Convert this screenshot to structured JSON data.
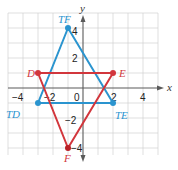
{
  "figure": {
    "type": "coordinate-plane",
    "axes": {
      "x_label": "x",
      "y_label": "y",
      "x_range": [
        -4.5,
        4.5
      ],
      "y_range": [
        -5,
        5
      ],
      "x_tick_labels": [
        "-4",
        "-2",
        "0",
        "2",
        "4"
      ],
      "y_tick_labels": [
        "4",
        "2",
        "-2",
        "-4"
      ],
      "origin_label": "0",
      "grid": true
    },
    "triangles": [
      {
        "name": "DEF",
        "color": "#d2363c",
        "vertices": [
          {
            "label": "D",
            "x": -3,
            "y": 1
          },
          {
            "label": "E",
            "x": 2,
            "y": 1
          },
          {
            "label": "F",
            "x": -1,
            "y": -4
          }
        ]
      },
      {
        "name": "TD TE TF",
        "color": "#2a94cf",
        "vertices": [
          {
            "label": "TD",
            "x": -3,
            "y": -1
          },
          {
            "label": "TE",
            "x": 2,
            "y": -1
          },
          {
            "label": "TF",
            "x": -1,
            "y": 4
          }
        ]
      }
    ]
  },
  "labels": {
    "x_axis": "x",
    "y_axis": "y",
    "tick_x_neg4": "−4",
    "tick_x_neg2": "−2",
    "tick_origin": "0",
    "tick_x_2": "2",
    "tick_x_4": "4",
    "tick_y_4": "4",
    "tick_y_2": "2",
    "tick_y_neg2": "−2",
    "tick_y_neg4": "−4",
    "D": "D",
    "E": "E",
    "F": "F",
    "TD": "TD",
    "TE": "TE",
    "TF": "TF"
  }
}
